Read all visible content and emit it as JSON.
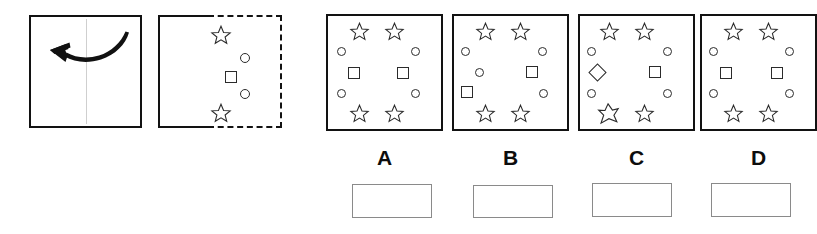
{
  "puzzle": {
    "type": "paper-folding-spatial-reasoning",
    "prompt": {
      "fold_panel": {
        "name": "fold-instruction-panel",
        "arrow_icon": "curved-arrow-left-icon",
        "fold_line": "vertical-center-crease",
        "description": "Square sheet with vertical center crease and a curved arrow pointing left indicating the right half folds over onto the left half."
      },
      "folded_panel": {
        "name": "folded-paper-panel",
        "solid_half": "left-half-solid-outline",
        "dashed_half": "right-half-dashed-outline",
        "description": "Left half drawn with solid outline (the folded-over flap); right half drawn dashed showing the hidden shapes.",
        "shapes": [
          {
            "kind": "star",
            "label": "star-top"
          },
          {
            "kind": "circle",
            "label": "circle-upper"
          },
          {
            "kind": "square",
            "label": "square-middle"
          },
          {
            "kind": "circle",
            "label": "circle-lower"
          },
          {
            "kind": "star",
            "label": "star-bottom"
          }
        ]
      }
    },
    "options": [
      {
        "id": "A",
        "label": "A",
        "name": "option-a",
        "symmetric": true,
        "shapes": [
          {
            "kind": "star",
            "side": "left",
            "row": "top"
          },
          {
            "kind": "star",
            "side": "right",
            "row": "top"
          },
          {
            "kind": "circle",
            "side": "left",
            "row": "upper"
          },
          {
            "kind": "circle",
            "side": "right",
            "row": "upper"
          },
          {
            "kind": "square",
            "side": "left",
            "row": "middle"
          },
          {
            "kind": "square",
            "side": "right",
            "row": "middle"
          },
          {
            "kind": "circle",
            "side": "left",
            "row": "lower"
          },
          {
            "kind": "circle",
            "side": "right",
            "row": "lower"
          },
          {
            "kind": "star",
            "side": "left",
            "row": "bottom"
          },
          {
            "kind": "star",
            "side": "right",
            "row": "bottom"
          }
        ]
      },
      {
        "id": "B",
        "label": "B",
        "name": "option-b",
        "symmetric": false,
        "shapes": [
          {
            "kind": "star",
            "side": "left",
            "row": "top"
          },
          {
            "kind": "star",
            "side": "right",
            "row": "top"
          },
          {
            "kind": "circle",
            "side": "left",
            "row": "upper"
          },
          {
            "kind": "circle",
            "side": "right",
            "row": "upper"
          },
          {
            "kind": "circle",
            "side": "left",
            "row": "middle"
          },
          {
            "kind": "square",
            "side": "right",
            "row": "middle"
          },
          {
            "kind": "square",
            "side": "left",
            "row": "lower"
          },
          {
            "kind": "circle",
            "side": "right",
            "row": "lower"
          },
          {
            "kind": "star",
            "side": "left",
            "row": "bottom"
          },
          {
            "kind": "star",
            "side": "right",
            "row": "bottom"
          }
        ]
      },
      {
        "id": "C",
        "label": "C",
        "name": "option-c",
        "symmetric": false,
        "shapes": [
          {
            "kind": "star",
            "side": "left",
            "row": "top"
          },
          {
            "kind": "star",
            "side": "right",
            "row": "top"
          },
          {
            "kind": "circle",
            "side": "left",
            "row": "upper"
          },
          {
            "kind": "circle",
            "side": "right",
            "row": "upper"
          },
          {
            "kind": "diamond",
            "side": "left",
            "row": "middle"
          },
          {
            "kind": "square",
            "side": "right",
            "row": "middle"
          },
          {
            "kind": "circle",
            "side": "left",
            "row": "lower"
          },
          {
            "kind": "circle",
            "side": "right",
            "row": "lower"
          },
          {
            "kind": "star-skewed",
            "side": "left",
            "row": "bottom"
          },
          {
            "kind": "star",
            "side": "right",
            "row": "bottom"
          }
        ]
      },
      {
        "id": "D",
        "label": "D",
        "name": "option-d",
        "symmetric": true,
        "shapes": [
          {
            "kind": "star",
            "side": "left",
            "row": "top"
          },
          {
            "kind": "star",
            "side": "right",
            "row": "top"
          },
          {
            "kind": "circle",
            "side": "left",
            "row": "upper"
          },
          {
            "kind": "circle",
            "side": "right",
            "row": "upper"
          },
          {
            "kind": "square",
            "side": "left",
            "row": "middle"
          },
          {
            "kind": "square",
            "side": "right",
            "row": "middle"
          },
          {
            "kind": "circle",
            "side": "left",
            "row": "lower"
          },
          {
            "kind": "circle",
            "side": "right",
            "row": "lower"
          },
          {
            "kind": "star",
            "side": "left",
            "row": "bottom"
          },
          {
            "kind": "star",
            "side": "right",
            "row": "bottom"
          }
        ]
      }
    ],
    "answer_boxes": [
      {
        "for": "A",
        "name": "answer-box-a",
        "value": ""
      },
      {
        "for": "B",
        "name": "answer-box-b",
        "value": ""
      },
      {
        "for": "C",
        "name": "answer-box-c",
        "value": ""
      },
      {
        "for": "D",
        "name": "answer-box-d",
        "value": ""
      }
    ]
  },
  "colors": {
    "ink": "#121212",
    "shape_stroke": "#2b2b2b",
    "crease": "#cfcfcf",
    "answer_box_border": "#8a8a8a",
    "background": "#ffffff"
  }
}
